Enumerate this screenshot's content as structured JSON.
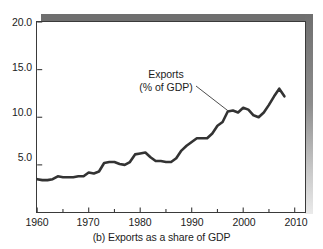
{
  "figure": {
    "caption": "(b) Exports as a share of GDP",
    "annotation_line1": "Exports",
    "annotation_line2": "(% of GDP)"
  },
  "chart_data": {
    "type": "line",
    "title": "(b) Exports as a share of GDP",
    "xlabel": "",
    "ylabel": "",
    "xlim": [
      1960,
      2012
    ],
    "ylim": [
      0,
      20
    ],
    "grid": false,
    "legend": "none",
    "annotations": [
      {
        "text": "Exports (% of GDP)",
        "points_to_year": 1997,
        "points_to_value": 10.7
      }
    ],
    "xticks_major": [
      1960,
      1970,
      1980,
      1990,
      2000,
      2010
    ],
    "xticklabels": [
      "1960",
      "1970",
      "1980",
      "1990",
      "2000",
      "2010"
    ],
    "xticks_minor": [
      1965,
      1975,
      1985,
      1995,
      2005
    ],
    "yticks": [
      5.0,
      10.0,
      15.0,
      20.0
    ],
    "yticklabels": [
      "5.0",
      "10.0",
      "15.0",
      "20.0"
    ],
    "series": [
      {
        "name": "Exports (% of GDP)",
        "color": "#333333",
        "x": [
          1960,
          1961,
          1962,
          1963,
          1964,
          1965,
          1966,
          1967,
          1968,
          1969,
          1970,
          1971,
          1972,
          1973,
          1974,
          1975,
          1976,
          1977,
          1978,
          1979,
          1980,
          1981,
          1982,
          1983,
          1984,
          1985,
          1986,
          1987,
          1988,
          1989,
          1990,
          1991,
          1992,
          1993,
          1994,
          1995,
          1996,
          1997,
          1998,
          1999,
          2000,
          2001,
          2002,
          2003,
          2004,
          2005,
          2006,
          2007,
          2008
        ],
        "y": [
          3.5,
          3.4,
          3.4,
          3.5,
          3.8,
          3.7,
          3.7,
          3.7,
          3.8,
          3.8,
          4.2,
          4.1,
          4.3,
          5.2,
          5.3,
          5.3,
          5.1,
          5.0,
          5.3,
          6.1,
          6.2,
          6.3,
          5.8,
          5.4,
          5.4,
          5.3,
          5.3,
          5.7,
          6.5,
          7.0,
          7.4,
          7.8,
          7.8,
          7.8,
          8.3,
          9.1,
          9.5,
          10.6,
          10.7,
          10.5,
          11.0,
          10.8,
          10.2,
          10.0,
          10.5,
          11.3,
          12.2,
          13.0,
          12.2
        ]
      }
    ]
  },
  "axis": {
    "y_ticks": [
      {
        "label": "20.0",
        "value": 20.0
      },
      {
        "label": "15.0",
        "value": 15.0
      },
      {
        "label": "10.0",
        "value": 10.0
      },
      {
        "label": "5.0",
        "value": 5.0
      }
    ],
    "x_ticks": [
      {
        "label": "1960",
        "value": 1960
      },
      {
        "label": "1970",
        "value": 1970
      },
      {
        "label": "1980",
        "value": 1980
      },
      {
        "label": "1990",
        "value": 1990
      },
      {
        "label": "2000",
        "value": 2000
      },
      {
        "label": "2010",
        "value": 2010
      }
    ]
  },
  "colors": {
    "line": "#333333",
    "axis": "#3a3a3a",
    "shadow": "#6f6f6f",
    "text": "#1c1c1c"
  }
}
